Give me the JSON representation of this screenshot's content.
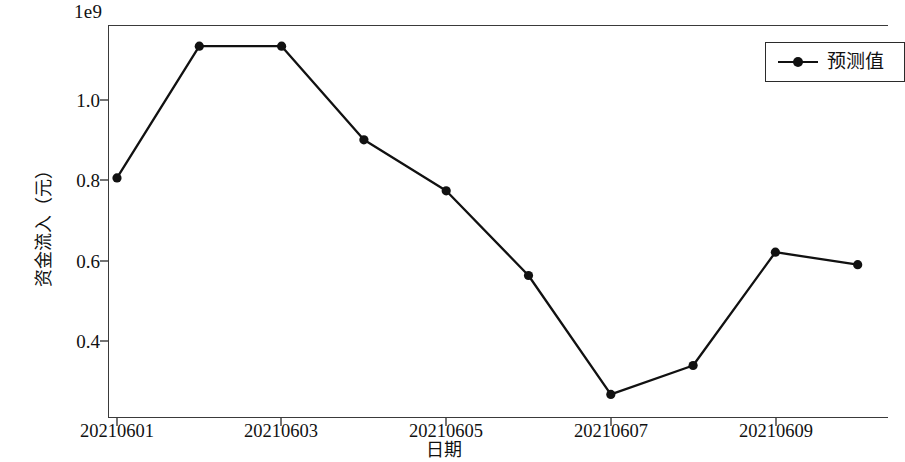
{
  "chart_data": {
    "type": "line",
    "title": "",
    "xlabel": "日期",
    "ylabel": "资金流入（元）",
    "offset_label": "1e9",
    "grid": false,
    "legend_position": "upper right",
    "x_categories": [
      "20210601",
      "20210602",
      "20210603",
      "20210604",
      "20210605",
      "20210606",
      "20210607",
      "20210608",
      "20210609",
      "20210610"
    ],
    "x_tick_labels": [
      "20210601",
      "20210603",
      "20210605",
      "20210607",
      "20210609"
    ],
    "y_tick_labels": [
      "0.4",
      "0.6",
      "0.8",
      "1.0"
    ],
    "y_tick_values": [
      0.4,
      0.6,
      0.8,
      1.0
    ],
    "ylim": [
      0.23,
      1.18
    ],
    "xlim": [
      0,
      9.4
    ],
    "series": [
      {
        "name": "预测值",
        "color": "#111111",
        "marker": "o",
        "values": [
          0.806,
          1.134,
          1.134,
          0.901,
          0.774,
          0.563,
          0.267,
          0.339,
          0.621,
          0.59
        ]
      }
    ]
  },
  "legend": {
    "entries": [
      {
        "label": "预测值"
      }
    ]
  },
  "axes": {
    "x_title": "日期",
    "y_title": "资金流入（元）",
    "offset": "1e9"
  }
}
